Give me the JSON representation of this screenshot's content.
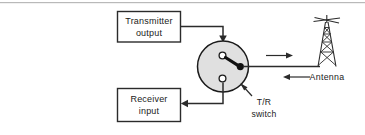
{
  "figure": {
    "background_color": "#ffffff",
    "line_color": "#2b2b2b",
    "switch_fill_color": "#e0e0e0"
  },
  "blocks": {
    "transmitter": {
      "line1": "Transmitter",
      "line2": "output"
    },
    "receiver": {
      "line1": "Receiver",
      "line2": "input"
    }
  },
  "switch": {
    "label_line1": "T/R",
    "label_line2": "switch",
    "contacts": [
      "transmit-contact",
      "receive-contact"
    ],
    "pole": "antenna-pole",
    "position": "transmit"
  },
  "antenna": {
    "label": "Antenna",
    "transmit_direction": "right",
    "receive_direction": "left"
  },
  "icons": {
    "arrow_down": "arrow-down-icon",
    "arrow_left": "arrow-left-icon",
    "arrow_right": "arrow-right-icon",
    "antenna_tower": "antenna-tower-icon",
    "pointer": "callout-pointer-icon"
  }
}
